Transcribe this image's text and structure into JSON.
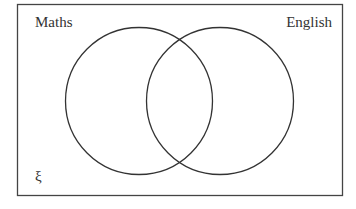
{
  "diagram": {
    "type": "venn",
    "universal_symbol": "ξ",
    "sets": [
      {
        "label": "Maths"
      },
      {
        "label": "English"
      }
    ],
    "colors": {
      "stroke": "#333333",
      "background": "#ffffff"
    }
  }
}
